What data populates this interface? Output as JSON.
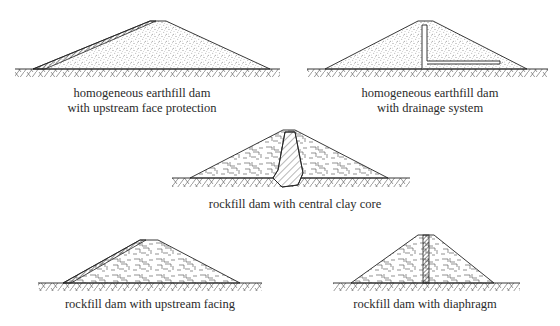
{
  "figure": {
    "type": "dam-types-cross-sections",
    "colors": {
      "line": "#222222",
      "fill": "#ffffff",
      "text": "#2a2a2a"
    },
    "panels": [
      {
        "id": "homogeneous-face-protection",
        "caption_lines": [
          "homogeneous earthfill dam",
          "with upstream face protection"
        ],
        "fill": "earth-stipple",
        "feature": "upstream face protection layer"
      },
      {
        "id": "homogeneous-drainage",
        "caption_lines": [
          "homogeneous earthfill dam",
          "with drainage system"
        ],
        "fill": "earth-stipple",
        "feature": "vertical chimney drain with horizontal blanket drain"
      },
      {
        "id": "rockfill-clay-core",
        "caption_lines": [
          "rockfill dam with central clay core"
        ],
        "fill": "rockfill",
        "feature": "central hatched clay core extending below ground"
      },
      {
        "id": "rockfill-upstream-facing",
        "caption_lines": [
          "rockfill dam with upstream facing"
        ],
        "fill": "rockfill",
        "feature": "thin upstream facing layer"
      },
      {
        "id": "rockfill-diaphragm",
        "caption_lines": [
          "rockfill dam with diaphragm"
        ],
        "fill": "rockfill",
        "feature": "central vertical diaphragm wall"
      }
    ]
  }
}
